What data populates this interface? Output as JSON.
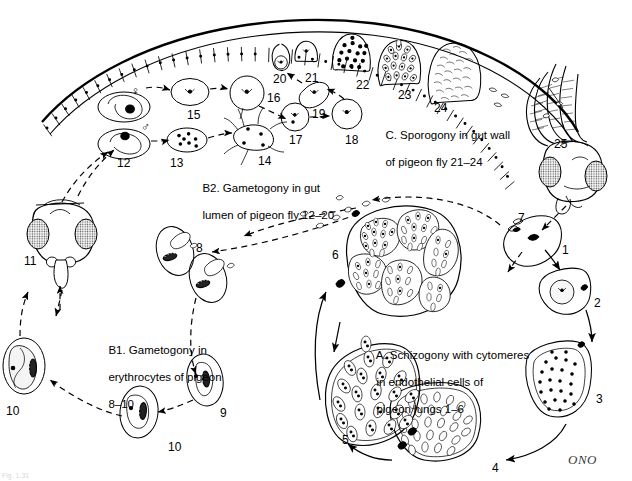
{
  "figure": {
    "title_hidden_caption": "Fig. 1.31",
    "signature": "ONO",
    "background": "#ffffff",
    "ink": "#000000"
  },
  "captions": [
    {
      "id": "caption-a",
      "text": "A. Schizogony with cytomeres\nin endothelial cells of\npigeon lungs 1–6",
      "lines": [
        "A. Schizogony with cytomeres",
        "in endothelial cells of",
        "pigeon lungs 1–6"
      ]
    },
    {
      "id": "caption-b1",
      "text": "B1. Gametogony in\nerythrocytes of pigeon\n8–10",
      "lines": [
        "B1. Gametogony in",
        "erythrocytes of pigeon",
        "8–10"
      ]
    },
    {
      "id": "caption-b2",
      "text": "B2. Gametogony in gut\nlumen of pigeon fly 12–20",
      "lines": [
        "B2. Gametogony in gut",
        "lumen of pigeon fly 12–20"
      ]
    },
    {
      "id": "caption-c",
      "text": "C. Sporogony in gut wall\nof pigeon fly 21–24",
      "lines": [
        "C. Sporogony in gut wall",
        "of pigeon fly 21–24"
      ]
    }
  ],
  "stage_numbers": [
    {
      "n": "1",
      "x": 562,
      "y": 243,
      "stage": "sporozoite-entering-endothelial-cell"
    },
    {
      "n": "2",
      "x": 594,
      "y": 296,
      "stage": "uninucleate-trophozoite"
    },
    {
      "n": "3",
      "x": 596,
      "y": 392,
      "stage": "multinucleate-schizont"
    },
    {
      "n": "4",
      "x": 492,
      "y": 461,
      "stage": "cytomere-formation"
    },
    {
      "n": "5",
      "x": 342,
      "y": 433,
      "stage": "mature-cytomeres"
    },
    {
      "n": "6",
      "x": 332,
      "y": 248,
      "stage": "merozoite-release"
    },
    {
      "n": "7",
      "x": 518,
      "y": 211,
      "stage": "merozoites-to-blood"
    },
    {
      "n": "8",
      "x": 196,
      "y": 241,
      "stage": "young-gametocyte-in-erythrocyte"
    },
    {
      "n": "9",
      "x": 220,
      "y": 406,
      "stage": "growing-gametocyte"
    },
    {
      "n": "10",
      "x": 168,
      "y": 440,
      "stage": "mature-gametocyte"
    },
    {
      "n": "10",
      "x": 6,
      "y": 404,
      "stage": "mature-gametocyte-macrogametocyte"
    },
    {
      "n": "11",
      "x": 24,
      "y": 254,
      "stage": "pigeon-fly-head-ingestion"
    },
    {
      "n": "12",
      "x": 117,
      "y": 156,
      "stage": "gametocytes-released-in-gut"
    },
    {
      "n": "13",
      "x": 170,
      "y": 156,
      "stage": "microgametocyte-exflagellation"
    },
    {
      "n": "14",
      "x": 258,
      "y": 154,
      "stage": "microgamete"
    },
    {
      "n": "15",
      "x": 187,
      "y": 108,
      "stage": "macrogamete"
    },
    {
      "n": "16",
      "x": 267,
      "y": 91,
      "stage": "fertilization-zygote"
    },
    {
      "n": "17",
      "x": 289,
      "y": 133,
      "stage": "zygote"
    },
    {
      "n": "18",
      "x": 345,
      "y": 133,
      "stage": "zygote-maturing"
    },
    {
      "n": "19",
      "x": 312,
      "y": 107,
      "stage": "ookinete"
    },
    {
      "n": "20",
      "x": 273,
      "y": 72,
      "stage": "ookinete-penetrating-epithelium"
    },
    {
      "n": "21",
      "x": 305,
      "y": 71,
      "stage": "young-oocyst"
    },
    {
      "n": "22",
      "x": 356,
      "y": 78,
      "stage": "oocyst-nuclear-division"
    },
    {
      "n": "23",
      "x": 398,
      "y": 88,
      "stage": "oocyst-sporoblasts"
    },
    {
      "n": "24",
      "x": 434,
      "y": 101,
      "stage": "mature-oocyst-sporozoites"
    },
    {
      "n": "25",
      "x": 554,
      "y": 137,
      "stage": "sporozoites-in-salivary-glands"
    }
  ],
  "sex_symbols": [
    {
      "glyph": "♀",
      "x": 131,
      "y": 84,
      "name": "female-macrogametocyte-symbol"
    },
    {
      "glyph": "♂",
      "x": 141,
      "y": 120,
      "name": "male-microgametocyte-symbol"
    }
  ]
}
